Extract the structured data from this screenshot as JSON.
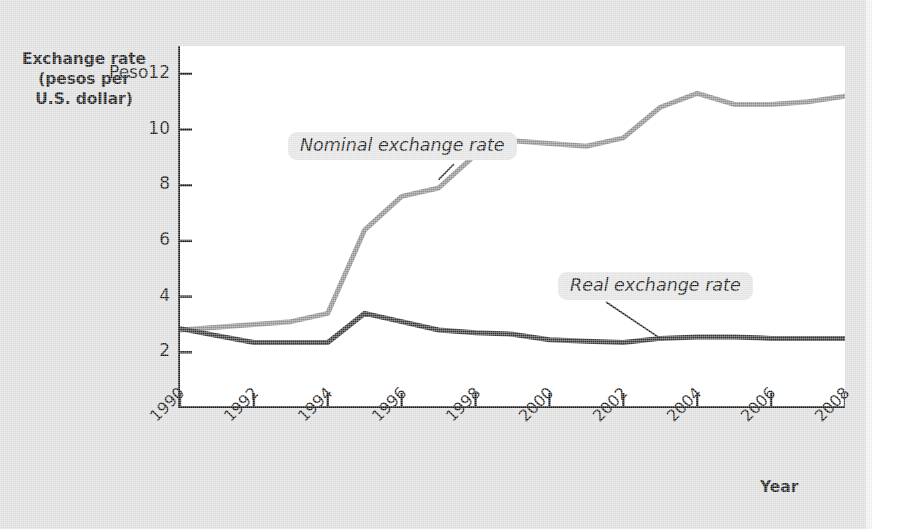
{
  "figure": {
    "background_color": "#dcdcdc",
    "plot_background_color": "#ffffff"
  },
  "axes": {
    "y_title_lines": [
      "Exchange rate",
      "(pesos per",
      "U.S. dollar)"
    ],
    "x_title": "Year",
    "y_tick_labels": [
      "Peso12",
      "10",
      "8",
      "6",
      "4",
      "2"
    ],
    "x_tick_labels": [
      "1990",
      "1992",
      "1994",
      "1996",
      "1998",
      "2000",
      "2002",
      "2004",
      "2006",
      "2008"
    ]
  },
  "annotations": {
    "nominal_label": "Nominal exchange rate",
    "real_label": "Real exchange rate"
  },
  "chart_data": {
    "type": "line",
    "title": "",
    "xlabel": "Year",
    "ylabel": "Exchange rate (pesos per U.S. dollar)",
    "xlim": [
      1990,
      2008
    ],
    "ylim": [
      0,
      13
    ],
    "y_ticks": [
      2,
      4,
      6,
      8,
      10,
      12
    ],
    "y_tick_labels": [
      "2",
      "4",
      "6",
      "8",
      "10",
      "Peso12"
    ],
    "x_ticks": [
      1990,
      1992,
      1994,
      1996,
      1998,
      2000,
      2002,
      2004,
      2006,
      2008
    ],
    "grid": false,
    "legend": "inline-callouts",
    "x": [
      1990,
      1991,
      1992,
      1993,
      1994,
      1995,
      1996,
      1997,
      1998,
      1999,
      2000,
      2001,
      2002,
      2003,
      2004,
      2005,
      2006,
      2007,
      2008
    ],
    "series": [
      {
        "name": "Nominal exchange rate",
        "color": "#8d8d8d",
        "line_width": 5,
        "values": [
          2.8,
          2.9,
          3.0,
          3.1,
          3.4,
          6.4,
          7.6,
          7.9,
          9.1,
          9.6,
          9.5,
          9.4,
          9.7,
          10.8,
          11.3,
          10.9,
          10.9,
          11.0,
          11.2
        ]
      },
      {
        "name": "Real exchange rate",
        "color": "#333333",
        "line_width": 5,
        "values": [
          2.85,
          2.6,
          2.35,
          2.35,
          2.35,
          3.4,
          3.1,
          2.8,
          2.7,
          2.65,
          2.45,
          2.4,
          2.35,
          2.5,
          2.55,
          2.55,
          2.5,
          2.5,
          2.5
        ]
      }
    ],
    "annotations": [
      {
        "text": "Nominal exchange rate",
        "points_to_year": 1997,
        "points_to_value": 8.2
      },
      {
        "text": "Real exchange rate",
        "points_to_year": 2003,
        "points_to_value": 2.5
      }
    ]
  }
}
